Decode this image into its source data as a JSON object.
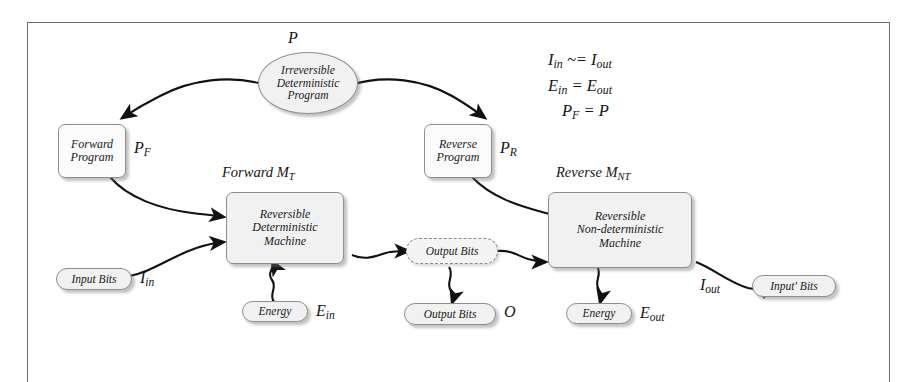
{
  "nodes": {
    "irreversible_program": "Irreversible\nDeterministic\nProgram",
    "irreversible_program_lines": [
      "Irreversible",
      "Deterministic",
      "Program"
    ],
    "forward_program_lines": [
      "Forward",
      "Program"
    ],
    "reverse_program_lines": [
      "Reverse",
      "Program"
    ],
    "forward_machine_lines": [
      "Reversible",
      "Deterministic",
      "Machine"
    ],
    "reverse_machine_lines": [
      "Reversible",
      "Non-deterministic",
      "Machine"
    ],
    "input_bits": "Input Bits",
    "energy_in": "Energy",
    "output_bits_virtual": "Output Bits",
    "output_bits_real": "Output Bits",
    "energy_out": "Energy",
    "input_prime_bits": "Input' Bits"
  },
  "labels": {
    "program_symbol": "P",
    "forward_program_symbol_base": "P",
    "forward_program_symbol_sub": "F",
    "reverse_program_symbol_base": "P",
    "reverse_program_symbol_sub": "R",
    "forward_machine_caption_text": "Forward",
    "forward_machine_caption_base": "M",
    "forward_machine_caption_sub": "T",
    "reverse_machine_caption_text": "Reverse",
    "reverse_machine_caption_base": "M",
    "reverse_machine_caption_sub": "NT",
    "input_bits_symbol_base": "I",
    "input_bits_symbol_sub": "in",
    "energy_in_symbol_base": "E",
    "energy_in_symbol_sub": "in",
    "output_bits_symbol": "O",
    "energy_out_symbol_base": "E",
    "energy_out_symbol_sub": "out",
    "output_flow_symbol_base": "I",
    "output_flow_symbol_sub": "out"
  },
  "equations": [
    {
      "lhs_base": "I",
      "lhs_sub": "in",
      "op": " ~= ",
      "rhs_base": "I",
      "rhs_sub": "out"
    },
    {
      "lhs_base": "E",
      "lhs_sub": "in",
      "op": " = ",
      "rhs_base": "E",
      "rhs_sub": "out"
    },
    {
      "lhs_base": "P",
      "lhs_sub": "F",
      "op": " = ",
      "rhs_base": "P",
      "rhs_sub": ""
    }
  ],
  "equations_text": [
    "Iin ~= Iout",
    "Ein = Eout",
    "PF = P"
  ],
  "colors": {
    "frame_border": "#6a6a6a",
    "node_fill": "#f1f1f1",
    "node_border": "#8e8e8e",
    "dashed_border": "#8a8a8a",
    "arrow": "#111111",
    "text": "#141414",
    "background": "#ffffff"
  }
}
